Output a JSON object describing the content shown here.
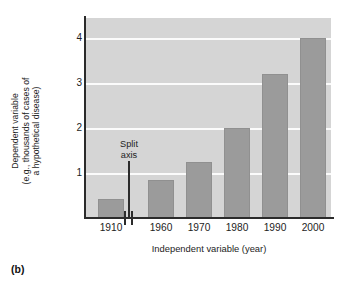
{
  "figure": {
    "panel_label": "(b)"
  },
  "annotations": {
    "split_axis_line1": "Split",
    "split_axis_line2": "axis"
  },
  "ylabel_lines": {
    "line1": "Dependent variable",
    "line2": "(e.g., thousands of cases of",
    "line3": "a hypothetical disease)"
  },
  "colors": {
    "plot_background": "#d5d5d5",
    "bar_fill": "#9b9b9b",
    "gridline": "#fbfbfb",
    "axis": "#2b2b2b",
    "text": "#1d1d1d"
  },
  "chart_data": {
    "type": "bar",
    "title": "",
    "subtitle": "",
    "xlabel": "Independent variable (year)",
    "ylabel": "Dependent variable (e.g., thousands of cases of a hypothetical disease)",
    "categories": [
      "1910",
      "1960",
      "1970",
      "1980",
      "1990",
      "2000"
    ],
    "values": [
      0.42,
      0.85,
      1.25,
      2.0,
      3.2,
      4.0
    ],
    "ylim": [
      0,
      4.45
    ],
    "yticks": [
      1,
      2,
      3,
      4
    ],
    "ytick_labels": [
      "1",
      "2",
      "3",
      "4"
    ],
    "grid": true,
    "legend": "none",
    "axis_break": {
      "present": true,
      "between": [
        "1910",
        "1960"
      ],
      "annotation": "Split axis"
    }
  }
}
